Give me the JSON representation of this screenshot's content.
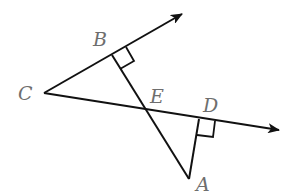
{
  "diagram": {
    "type": "geometry",
    "stroke_color": "#111111",
    "label_color": "#6e6e6e",
    "points": {
      "C": {
        "label": "C",
        "x": 44,
        "y": 93,
        "label_x": 18,
        "label_y": 100
      },
      "B": {
        "label": "B",
        "x": 112,
        "y": 55,
        "label_x": 93,
        "label_y": 46
      },
      "E": {
        "label": "E",
        "x": 147,
        "y": 110,
        "label_x": 150,
        "label_y": 103
      },
      "D": {
        "label": "D",
        "x": 199,
        "y": 119,
        "label_x": 203,
        "label_y": 112
      },
      "A": {
        "label": "A",
        "x": 189,
        "y": 179,
        "label_x": 196,
        "label_y": 191
      }
    },
    "rays": [
      {
        "from": "C",
        "through": "B",
        "tip": [
          182,
          14
        ]
      },
      {
        "from": "C",
        "through": "D",
        "tip": [
          279,
          130
        ]
      }
    ],
    "segments": [
      {
        "from": "B",
        "to": "A"
      },
      {
        "from": "D",
        "to": "A"
      }
    ],
    "right_angles": [
      {
        "at": "B",
        "polyline": "126,47 134,61 120,69"
      },
      {
        "at": "D",
        "polyline": "215,121 213,137 197,135"
      }
    ]
  }
}
